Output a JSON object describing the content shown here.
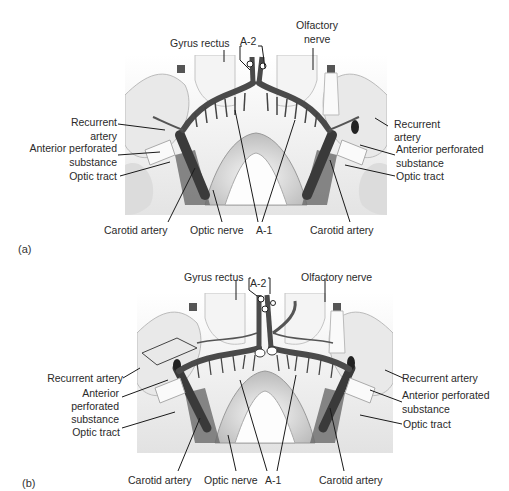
{
  "figure": {
    "panels": [
      {
        "letter": "(a)",
        "labels": {
          "gyrus_rectus": "Gyrus rectus",
          "a2": "A-2",
          "olfactory_nerve_1": "Olfactory",
          "olfactory_nerve_2": "nerve",
          "recurrent_artery_left_1": "Recurrent",
          "recurrent_artery_left_2": "artery",
          "anterior_perforated_left_1": "Anterior perforated",
          "anterior_perforated_left_2": "substance",
          "optic_tract_left": "Optic tract",
          "recurrent_artery_right_1": "Recurrent",
          "recurrent_artery_right_2": "artery",
          "anterior_perforated_right_1": "Anterior perforated",
          "anterior_perforated_right_2": "substance",
          "optic_tract_right": "Optic tract",
          "carotid_artery_left": "Carotid artery",
          "optic_nerve": "Optic nerve",
          "a1": "A-1",
          "carotid_artery_right": "Carotid artery"
        }
      },
      {
        "letter": "(b)",
        "labels": {
          "gyrus_rectus": "Gyrus rectus",
          "a2": "A-2",
          "olfactory_nerve": "Olfactory nerve",
          "recurrent_artery_left": "Recurrent artery",
          "anterior_perforated_left_1": "Anterior",
          "anterior_perforated_left_2": "perforated",
          "anterior_perforated_left_3": "substance",
          "optic_tract_left": "Optic tract",
          "recurrent_artery_right": "Recurrent artery",
          "anterior_perforated_right_1": "Anterior perforated",
          "anterior_perforated_right_2": "substance",
          "optic_tract_right": "Optic tract",
          "carotid_artery_left": "Carotid artery",
          "optic_nerve": "Optic nerve",
          "a1": "A-1",
          "carotid_artery_right": "Carotid artery"
        }
      }
    ],
    "colors": {
      "background": "#ffffff",
      "brain_light": "#f2f2f2",
      "brain_shade": "#c8c8c8",
      "artery": "#5a5a5a",
      "artery_dark": "#2e2e2e",
      "leader": "#1a1a1a"
    }
  }
}
